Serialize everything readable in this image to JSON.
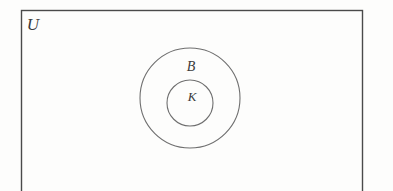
{
  "figure": {
    "kind": "euler-diagram",
    "background_color": "#fdfdfc"
  },
  "universe": {
    "label": "U",
    "shape": "rectangle",
    "stroke_color": "#4a4a4a",
    "x": 21.5,
    "y": 10.5,
    "width": 341,
    "height": 185,
    "label_x": 33,
    "label_y": 30
  },
  "outer_set": {
    "label": "B",
    "shape": "circle",
    "stroke_color": "#6f6f6f",
    "cx": 190,
    "cy": 98,
    "r": 50,
    "label_x": 191,
    "label_y": 71
  },
  "inner_set": {
    "label": "K",
    "shape": "circle",
    "stroke_color": "#6f6f6f",
    "cx": 190,
    "cy": 103,
    "r": 23,
    "label_x": 192,
    "label_y": 101
  }
}
